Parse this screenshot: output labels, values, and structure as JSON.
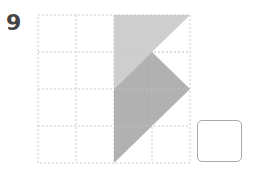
{
  "question": {
    "number": "9"
  },
  "grid": {
    "cols": 4,
    "rows": 4,
    "line_color": "#cccccc"
  },
  "shapes": {
    "light_color": "#c8c8c8",
    "dark_color": "#a8a8a8"
  },
  "answer_box": {
    "value": ""
  }
}
